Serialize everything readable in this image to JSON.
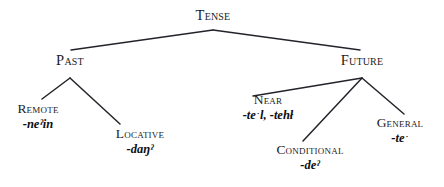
{
  "figure": {
    "type": "tree-diagram",
    "background_color": "#ffffff",
    "line_color": "#23232b",
    "text_color": "#1c1c22"
  },
  "tree": {
    "root": {
      "id": "tense",
      "label": "Tense",
      "form": ""
    },
    "nodes": [
      {
        "id": "past",
        "label": "Past",
        "form": ""
      },
      {
        "id": "future",
        "label": "Future",
        "form": ""
      },
      {
        "id": "remote",
        "label": "Remote",
        "form": "-neˀin"
      },
      {
        "id": "locative",
        "label": "Locative",
        "form": "-daŋˀ"
      },
      {
        "id": "near",
        "label": "Near",
        "form": "-teˑl, -tehł"
      },
      {
        "id": "conditional",
        "label": "Conditional",
        "form": "-deˀ"
      },
      {
        "id": "general",
        "label": "General",
        "form": "-teˑ"
      }
    ],
    "edges": [
      {
        "from": "tense",
        "to": "past"
      },
      {
        "from": "tense",
        "to": "future"
      },
      {
        "from": "past",
        "to": "remote"
      },
      {
        "from": "past",
        "to": "locative"
      },
      {
        "from": "future",
        "to": "near"
      },
      {
        "from": "future",
        "to": "conditional"
      },
      {
        "from": "future",
        "to": "general"
      }
    ]
  }
}
